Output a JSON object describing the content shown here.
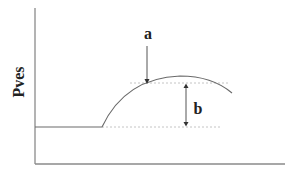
{
  "diagram": {
    "y_axis_label": "Pves",
    "annotations": {
      "a": "a",
      "b": "b"
    }
  }
}
